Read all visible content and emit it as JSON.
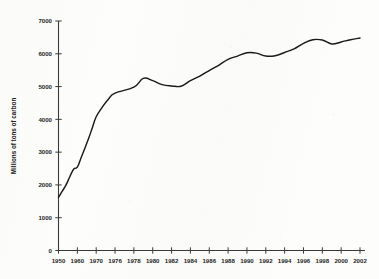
{
  "chart_data": {
    "type": "line",
    "title": "",
    "subtitle": "",
    "xlabel": "",
    "ylabel": "Millions of tons of carbon",
    "xlim": [
      1950,
      2002
    ],
    "ylim": [
      0,
      7000
    ],
    "grid": false,
    "legend": null,
    "y_ticks": [
      0,
      1000,
      2000,
      3000,
      4000,
      5000,
      6000,
      7000
    ],
    "y_tick_labels": [
      "0",
      "1000",
      "2000",
      "3000",
      "4000",
      "5000",
      "6000",
      "7000"
    ],
    "x_tick_labels": [
      "1950",
      "1960",
      "1970",
      "1976",
      "1978",
      "1980",
      "1982",
      "1984",
      "1986",
      "1988",
      "1990",
      "1992",
      "1994",
      "1996",
      "1998",
      "2000",
      "2002"
    ],
    "series": [
      {
        "name": "Global carbon emissions from fossil fuel burning",
        "color": "#1a1a1a",
        "x": [
          1950,
          1952,
          1954,
          1956,
          1958,
          1960,
          1962,
          1964,
          1966,
          1968,
          1970,
          1972,
          1974,
          1976,
          1978,
          1979,
          1980,
          1981,
          1982,
          1983,
          1984,
          1985,
          1986,
          1987,
          1988,
          1989,
          1990,
          1991,
          1992,
          1993,
          1994,
          1995,
          1996,
          1997,
          1998,
          1999,
          2000,
          2001,
          2002
        ],
        "values": [
          1620,
          1810,
          2000,
          2250,
          2480,
          2540,
          2830,
          3120,
          3420,
          3750,
          4080,
          4380,
          4630,
          4800,
          4980,
          5250,
          5180,
          5060,
          5020,
          5010,
          5180,
          5320,
          5490,
          5650,
          5830,
          5930,
          6030,
          6020,
          5930,
          5940,
          6040,
          6150,
          6320,
          6430,
          6420,
          6300,
          6360,
          6430,
          6480
        ]
      }
    ],
    "annotations": []
  },
  "figure": {
    "background_color": "#fdfdfc",
    "line_color": "#1a1a1a",
    "axis_color": "#3a3a3a",
    "text_color": "#252525"
  }
}
